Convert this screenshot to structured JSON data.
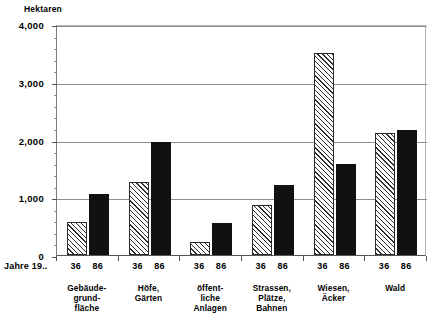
{
  "chart_data": {
    "type": "bar",
    "title": "",
    "subtitle": "",
    "ylabel": "Hektaren",
    "xlabel": "Jahre 19..",
    "ylim": [
      0,
      4000
    ],
    "ytick_labels": [
      "0",
      "1,000",
      "2,000",
      "3,000",
      "4,000"
    ],
    "ytick_values": [
      0,
      1000,
      2000,
      3000,
      4000
    ],
    "yminor_step": 200,
    "grid": true,
    "legend_position": "none",
    "categories": [
      "Gebäude-\ngrund-\nfläche",
      "Höfe,\nGärten",
      "öffent-\nliche\nAnlagen",
      "Strassen,\nPlätze,\nBahnen",
      "Wiesen,\nÄcker",
      "Wald"
    ],
    "series": [
      {
        "name": "36",
        "style": "hatched",
        "values": [
          580,
          1270,
          220,
          870,
          3500,
          2110
        ]
      },
      {
        "name": "86",
        "style": "solid",
        "values": [
          1050,
          1960,
          550,
          1210,
          1580,
          2160
        ]
      }
    ],
    "group_tick_labels": [
      [
        "36",
        "86"
      ],
      [
        "36",
        "86"
      ],
      [
        "36",
        "86"
      ],
      [
        "36",
        "86"
      ],
      [
        "36",
        "86"
      ],
      [
        "36",
        "86"
      ]
    ],
    "colors": {
      "hatched_fill": "#fdfdfd",
      "hatched_line": "#2f2f2f",
      "solid_fill": "#111111",
      "axis": "#555555",
      "gridline": "#8e8e8e",
      "background": "#ffffff"
    }
  }
}
